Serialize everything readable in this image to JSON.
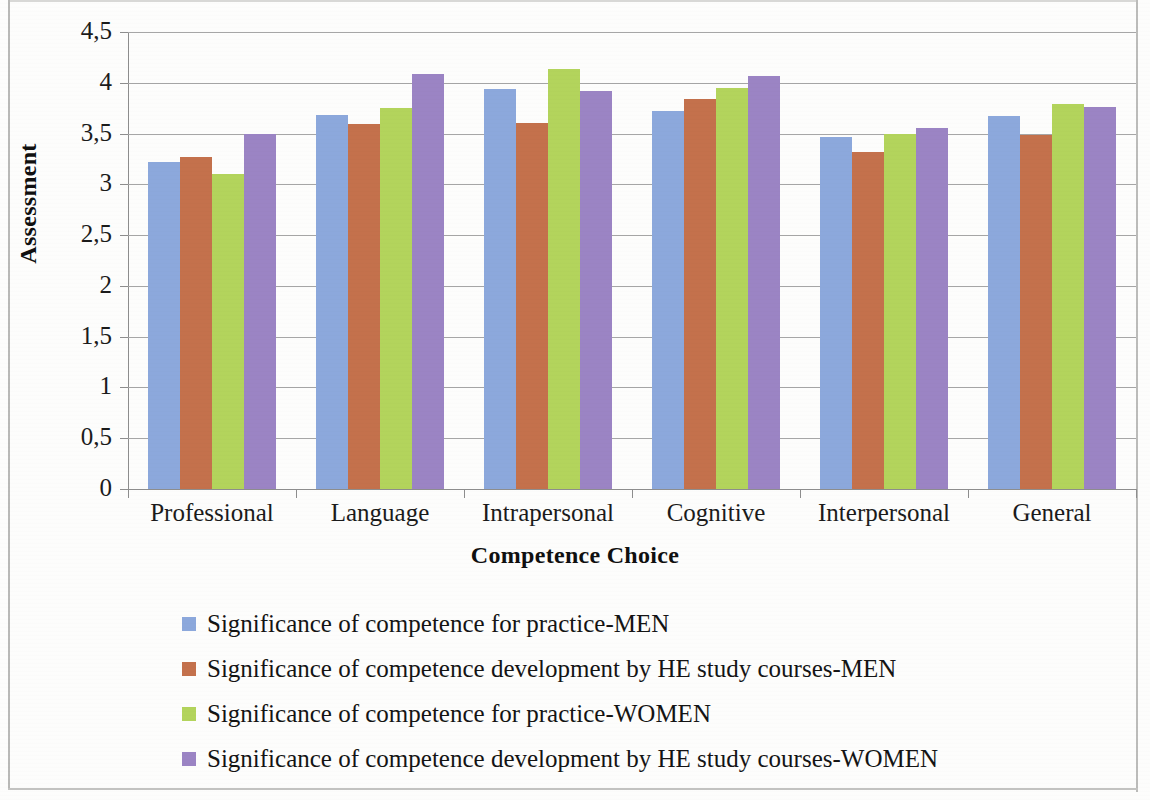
{
  "chart_data": {
    "type": "bar",
    "title": "",
    "xlabel": "Competence Choice",
    "ylabel": "Assessment",
    "categories": [
      "Professional",
      "Language",
      "Intrapersonal",
      "Cognitive",
      "Interpersonal",
      "General"
    ],
    "series": [
      {
        "name": "Significance of competence for practice-MEN",
        "color": "#8ca8dc",
        "values": [
          3.22,
          3.68,
          3.94,
          3.72,
          3.47,
          3.67
        ]
      },
      {
        "name": "Significance of competence development by HE study courses-MEN",
        "color": "#c4714c",
        "values": [
          3.27,
          3.59,
          3.6,
          3.84,
          3.32,
          3.49
        ]
      },
      {
        "name": "Significance of competence for practice-WOMEN",
        "color": "#b3d45c",
        "values": [
          3.1,
          3.75,
          4.14,
          3.95,
          3.5,
          3.79
        ]
      },
      {
        "name": "Significance of competence development by HE study courses-WOMEN",
        "color": "#9b84c4",
        "values": [
          3.5,
          4.09,
          3.92,
          4.07,
          3.55,
          3.76
        ]
      }
    ],
    "ylim": [
      0,
      4.5
    ],
    "ytick_values": [
      0,
      0.5,
      1,
      1.5,
      2,
      2.5,
      3,
      3.5,
      4,
      4.5
    ],
    "ytick_labels": [
      "0",
      "0,5",
      "1",
      "1,5",
      "2",
      "2,5",
      "3",
      "3,5",
      "4",
      "4,5"
    ],
    "grid": "horizontal",
    "legend_position": "bottom-left",
    "decimal_separator": ","
  },
  "legend": {
    "items": [
      {
        "label": "Significance of competence for practice-MEN",
        "swatch": "s0"
      },
      {
        "label": "Significance of competence development by HE study courses-MEN",
        "swatch": "s1"
      },
      {
        "label": "Significance of competence for practice-WOMEN",
        "swatch": "s2"
      },
      {
        "label": "Significance of competence development by HE study courses-WOMEN",
        "swatch": "s3"
      }
    ]
  }
}
